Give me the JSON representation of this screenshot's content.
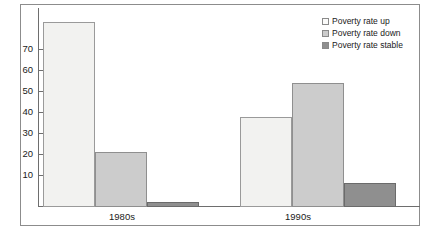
{
  "chart_data": {
    "type": "bar",
    "title": "",
    "subtitle": "",
    "xlabel": "",
    "ylabel": "",
    "categories": [
      "1980s",
      "1990s"
    ],
    "series": [
      {
        "name": "Poverty rate up",
        "values": [
          74,
          37.5
        ],
        "color": "#f2f2f0"
      },
      {
        "name": "Poverty rate down",
        "values": [
          22,
          49.5
        ],
        "color": "#cccccc"
      },
      {
        "name": "Poverty rate stable",
        "values": [
          2,
          9.5
        ],
        "color": "#8f8f8f"
      }
    ],
    "ylim": [
      0,
      76
    ],
    "yticks": [
      10,
      20,
      30,
      40,
      50,
      60,
      70
    ],
    "ytick_labels": [
      "10",
      "20",
      "30",
      "40",
      "50",
      "60",
      "70"
    ],
    "grid": false,
    "legend_position": "top-right",
    "legend": [
      "Poverty rate up",
      "Poverty rate down",
      "Poverty rate stable"
    ]
  },
  "axis": {
    "ticks": [
      {
        "label": "70",
        "top": 49
      },
      {
        "label": "60",
        "top": 70
      },
      {
        "label": "50",
        "top": 91
      },
      {
        "label": "40",
        "top": 112
      },
      {
        "label": "30",
        "top": 133
      },
      {
        "label": "20",
        "top": 154
      },
      {
        "label": "10",
        "top": 175
      }
    ]
  },
  "groups": [
    {
      "label": "1980s",
      "label_left": 92,
      "label_top": 212
    },
    {
      "label": "1990s",
      "label_left": 268,
      "label_top": 212
    }
  ],
  "bars": [
    {
      "name": "bar-1980s-up",
      "cls": "up",
      "left": 43,
      "width": 52,
      "top": 22,
      "height": 185
    },
    {
      "name": "bar-1980s-down",
      "cls": "down",
      "left": 95,
      "width": 52,
      "top": 152,
      "height": 55
    },
    {
      "name": "bar-1980s-stable",
      "cls": "stable",
      "left": 147,
      "width": 52,
      "top": 202,
      "height": 5
    },
    {
      "name": "bar-1990s-up",
      "cls": "up",
      "left": 240,
      "width": 52,
      "top": 117,
      "height": 90
    },
    {
      "name": "bar-1990s-down",
      "cls": "down",
      "left": 292,
      "width": 52,
      "top": 83,
      "height": 124
    },
    {
      "name": "bar-1990s-stable",
      "cls": "stable",
      "left": 344,
      "width": 52,
      "top": 183,
      "height": 24
    }
  ],
  "legend": {
    "items": [
      {
        "label": "Poverty rate up",
        "cls": "up"
      },
      {
        "label": "Poverty rate down",
        "cls": "down"
      },
      {
        "label": "Poverty rate stable",
        "cls": "stable"
      }
    ]
  },
  "colors": {
    "series_up": "#f2f2f0",
    "series_down": "#cccccc",
    "series_stable": "#8f8f8f",
    "axis": "#6e6e6e",
    "frame": "#8c8c8c",
    "text": "#1a1a1a"
  }
}
